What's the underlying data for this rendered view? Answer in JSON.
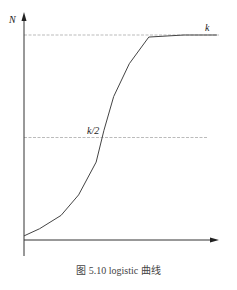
{
  "chart_data": {
    "type": "line",
    "title": "",
    "caption": "图 5.10    logistic 曲线",
    "xlabel": "",
    "ylabel": "N",
    "xlim": [
      0,
      10
    ],
    "ylim": [
      0,
      1.05
    ],
    "grid": false,
    "reference_lines": [
      {
        "label": "k",
        "y": 1.0
      },
      {
        "label": "k/2",
        "y": 0.5
      }
    ],
    "series": [
      {
        "name": "logistic",
        "x": [
          0,
          0.8,
          1.9,
          2.8,
          3.7,
          4.1,
          4.6,
          5.4,
          6.4,
          8.2,
          9.9
        ],
        "y": [
          0.02,
          0.055,
          0.12,
          0.22,
          0.38,
          0.535,
          0.7,
          0.86,
          0.99,
          1.0,
          1.0
        ]
      }
    ]
  }
}
